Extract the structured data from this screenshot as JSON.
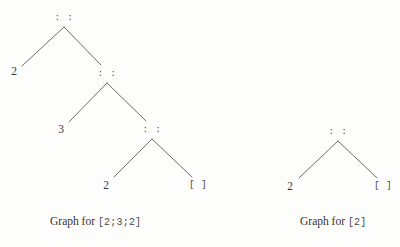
{
  "figure": {
    "kind": "cons-list-tree-diagram",
    "ink_color": "#3b3b3b",
    "edge_color": "#5a5a5a",
    "background_color": "#fdfdfc",
    "cons_symbol": ": :",
    "nil_symbol": "[ ]"
  },
  "graphs": [
    {
      "id": "graph-left",
      "caption_text": "Graph for ",
      "caption_code": "[2;3;2]",
      "caption_x": 50,
      "caption_y": 216,
      "nodes": [
        {
          "id": "left-root",
          "label": ": :",
          "type": "cons",
          "x": 64,
          "y": 13
        },
        {
          "id": "left-n1-2",
          "label": "2",
          "type": "value",
          "x": 14,
          "y": 66
        },
        {
          "id": "left-cons-2",
          "label": ": :",
          "type": "cons",
          "x": 107,
          "y": 69
        },
        {
          "id": "left-n2-3",
          "label": "3",
          "type": "value",
          "x": 61,
          "y": 124
        },
        {
          "id": "left-cons-3",
          "label": ": :",
          "type": "cons",
          "x": 152,
          "y": 125
        },
        {
          "id": "left-n3-2",
          "label": "2",
          "type": "value",
          "x": 106,
          "y": 180
        },
        {
          "id": "left-nil",
          "label": "[ ]",
          "type": "nil",
          "x": 198,
          "y": 180
        }
      ],
      "edges": [
        {
          "from": "left-root",
          "to": "left-n1-2",
          "x1": 64,
          "y1": 27,
          "x2": 22,
          "y2": 66
        },
        {
          "from": "left-root",
          "to": "left-cons-2",
          "x1": 64,
          "y1": 27,
          "x2": 101,
          "y2": 65
        },
        {
          "from": "left-cons-2",
          "to": "left-n2-3",
          "x1": 107,
          "y1": 83,
          "x2": 69,
          "y2": 122
        },
        {
          "from": "left-cons-2",
          "to": "left-cons-3",
          "x1": 107,
          "y1": 83,
          "x2": 146,
          "y2": 121
        },
        {
          "from": "left-cons-3",
          "to": "left-n3-2",
          "x1": 152,
          "y1": 139,
          "x2": 114,
          "y2": 177
        },
        {
          "from": "left-cons-3",
          "to": "left-nil",
          "x1": 152,
          "y1": 139,
          "x2": 192,
          "y2": 177
        }
      ]
    },
    {
      "id": "graph-right",
      "caption_text": "Graph for ",
      "caption_code": "[2]",
      "caption_x": 300,
      "caption_y": 216,
      "nodes": [
        {
          "id": "right-root",
          "label": ": :",
          "type": "cons",
          "x": 338,
          "y": 127
        },
        {
          "id": "right-2",
          "label": "2",
          "type": "value",
          "x": 290,
          "y": 181
        },
        {
          "id": "right-nil",
          "label": "[ ]",
          "type": "nil",
          "x": 383,
          "y": 181
        }
      ],
      "edges": [
        {
          "from": "right-root",
          "to": "right-2",
          "x1": 338,
          "y1": 141,
          "x2": 299,
          "y2": 178
        },
        {
          "from": "right-root",
          "to": "right-nil",
          "x1": 338,
          "y1": 141,
          "x2": 377,
          "y2": 178
        }
      ]
    }
  ]
}
